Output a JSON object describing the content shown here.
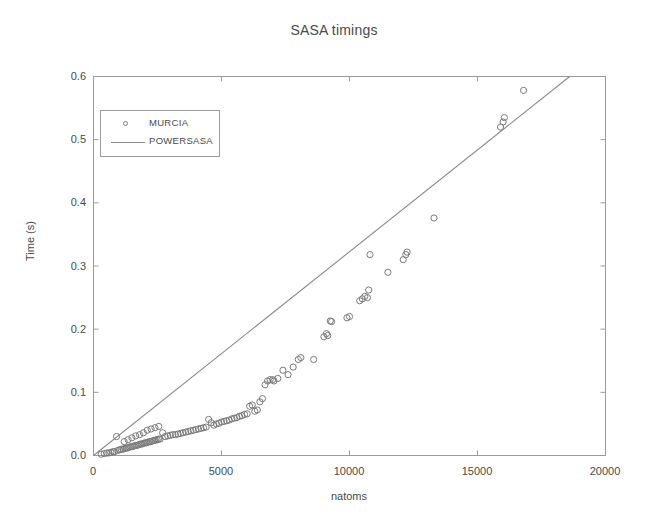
{
  "chart_data": {
    "type": "scatter",
    "title": "SASA timings",
    "xlabel": "natoms",
    "ylabel": "Time (s)",
    "xlim": [
      0,
      20000
    ],
    "ylim": [
      0.0,
      0.6
    ],
    "xticks": [
      0,
      5000,
      10000,
      15000,
      20000
    ],
    "xtick_labels": [
      "0",
      "5000",
      "10000",
      "15000",
      "20000"
    ],
    "yticks": [
      0.0,
      0.1,
      0.2,
      0.3,
      0.4,
      0.5,
      0.6
    ],
    "ytick_labels": [
      "0.0",
      "0.1",
      "0.2",
      "0.3",
      "0.4",
      "0.5",
      "0.6"
    ],
    "grid": false,
    "legend_position": "upper left",
    "legend": [
      {
        "label": "MURCIA",
        "marker": "open-circle",
        "style": "scatter",
        "color": "#7a7a7a"
      },
      {
        "label": "POWERSASA",
        "marker": "none",
        "style": "line",
        "color": "#8a8a8a"
      }
    ],
    "series": [
      {
        "name": "MURCIA",
        "type": "scatter",
        "marker": "open-circle",
        "color": "#7a7a7a",
        "points": [
          [
            300,
            0.002
          ],
          [
            420,
            0.003
          ],
          [
            520,
            0.004
          ],
          [
            600,
            0.004
          ],
          [
            680,
            0.005
          ],
          [
            760,
            0.006
          ],
          [
            820,
            0.006
          ],
          [
            900,
            0.03
          ],
          [
            950,
            0.008
          ],
          [
            1020,
            0.009
          ],
          [
            1080,
            0.01
          ],
          [
            1150,
            0.01
          ],
          [
            1220,
            0.011
          ],
          [
            1280,
            0.012
          ],
          [
            1340,
            0.012
          ],
          [
            1400,
            0.013
          ],
          [
            1460,
            0.014
          ],
          [
            1520,
            0.014
          ],
          [
            1580,
            0.015
          ],
          [
            1640,
            0.016
          ],
          [
            1700,
            0.016
          ],
          [
            1760,
            0.017
          ],
          [
            1820,
            0.018
          ],
          [
            1880,
            0.018
          ],
          [
            1940,
            0.019
          ],
          [
            2000,
            0.02
          ],
          [
            2060,
            0.02
          ],
          [
            2120,
            0.021
          ],
          [
            2180,
            0.022
          ],
          [
            2240,
            0.022
          ],
          [
            2300,
            0.023
          ],
          [
            2360,
            0.024
          ],
          [
            2420,
            0.024
          ],
          [
            2480,
            0.025
          ],
          [
            2540,
            0.026
          ],
          [
            2600,
            0.026
          ],
          [
            1200,
            0.022
          ],
          [
            1350,
            0.025
          ],
          [
            1500,
            0.028
          ],
          [
            1650,
            0.031
          ],
          [
            1800,
            0.033
          ],
          [
            1950,
            0.036
          ],
          [
            2100,
            0.04
          ],
          [
            2250,
            0.042
          ],
          [
            2400,
            0.044
          ],
          [
            2550,
            0.046
          ],
          [
            2700,
            0.036
          ],
          [
            2800,
            0.03
          ],
          [
            2900,
            0.031
          ],
          [
            3000,
            0.032
          ],
          [
            3100,
            0.033
          ],
          [
            3200,
            0.033
          ],
          [
            3300,
            0.034
          ],
          [
            3400,
            0.035
          ],
          [
            3500,
            0.036
          ],
          [
            3600,
            0.037
          ],
          [
            3700,
            0.038
          ],
          [
            3800,
            0.039
          ],
          [
            3900,
            0.04
          ],
          [
            4000,
            0.041
          ],
          [
            4100,
            0.042
          ],
          [
            4200,
            0.043
          ],
          [
            4300,
            0.044
          ],
          [
            4400,
            0.045
          ],
          [
            4500,
            0.057
          ],
          [
            4600,
            0.052
          ],
          [
            4700,
            0.048
          ],
          [
            4800,
            0.05
          ],
          [
            4900,
            0.051
          ],
          [
            5000,
            0.053
          ],
          [
            5100,
            0.054
          ],
          [
            5200,
            0.055
          ],
          [
            5300,
            0.056
          ],
          [
            5400,
            0.058
          ],
          [
            5500,
            0.059
          ],
          [
            5600,
            0.06
          ],
          [
            5700,
            0.062
          ],
          [
            5800,
            0.063
          ],
          [
            5900,
            0.065
          ],
          [
            6000,
            0.066
          ],
          [
            6100,
            0.078
          ],
          [
            6200,
            0.08
          ],
          [
            6300,
            0.07
          ],
          [
            6400,
            0.072
          ],
          [
            6500,
            0.085
          ],
          [
            6600,
            0.09
          ],
          [
            6700,
            0.112
          ],
          [
            6800,
            0.118
          ],
          [
            6900,
            0.12
          ],
          [
            7000,
            0.12
          ],
          [
            7050,
            0.118
          ],
          [
            7200,
            0.122
          ],
          [
            7400,
            0.135
          ],
          [
            7600,
            0.128
          ],
          [
            7800,
            0.14
          ],
          [
            8000,
            0.152
          ],
          [
            8100,
            0.155
          ],
          [
            8600,
            0.152
          ],
          [
            9000,
            0.188
          ],
          [
            9100,
            0.193
          ],
          [
            9150,
            0.19
          ],
          [
            9250,
            0.213
          ],
          [
            9300,
            0.212
          ],
          [
            9900,
            0.218
          ],
          [
            10000,
            0.22
          ],
          [
            10400,
            0.245
          ],
          [
            10500,
            0.248
          ],
          [
            10600,
            0.252
          ],
          [
            10700,
            0.25
          ],
          [
            10750,
            0.262
          ],
          [
            10800,
            0.318
          ],
          [
            11500,
            0.29
          ],
          [
            12100,
            0.31
          ],
          [
            12200,
            0.318
          ],
          [
            12250,
            0.322
          ],
          [
            13300,
            0.376
          ],
          [
            15900,
            0.52
          ],
          [
            16000,
            0.528
          ],
          [
            16050,
            0.535
          ],
          [
            16800,
            0.578
          ]
        ]
      },
      {
        "name": "POWERSASA",
        "type": "line",
        "color": "#8a8a8a",
        "points": [
          [
            0,
            0.0
          ],
          [
            18600,
            0.6
          ]
        ],
        "slope_per_atom": 3.226e-05
      }
    ]
  },
  "figure": {
    "title": "SASA timings",
    "xlabel": "natoms",
    "ylabel": "Time (s)",
    "legend": {
      "item0_label": "MURCIA",
      "item1_label": "POWERSASA"
    },
    "xticks": {
      "t0": "0",
      "t1": "5000",
      "t2": "10000",
      "t3": "15000",
      "t4": "20000"
    },
    "yticks": {
      "t0": "0.0",
      "t1": "0.1",
      "t2": "0.2",
      "t3": "0.3",
      "t4": "0.4",
      "t5": "0.5",
      "t6": "0.6"
    },
    "colors": {
      "axis": "#9b9b9b",
      "marker": "#7a7a7a",
      "line": "#8a8a8a",
      "text": "#4a4a4a",
      "background": "#ffffff"
    }
  }
}
